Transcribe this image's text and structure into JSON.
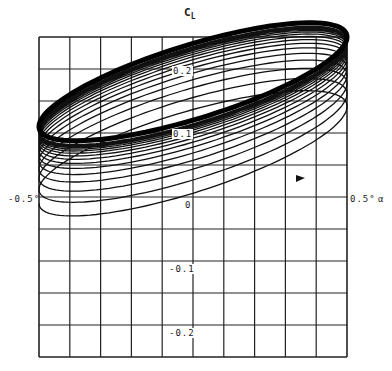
{
  "chart_data": {
    "type": "line",
    "title": "",
    "ylabel": "C_L",
    "xlabel": "α",
    "xlim": [
      -0.5,
      0.5
    ],
    "ylim": [
      -0.25,
      0.25
    ],
    "x_unit": "deg",
    "grid": true,
    "grid_divisions": {
      "x": 10,
      "y": 10
    },
    "x_tick_labels": [
      "-0.5°",
      "0",
      "0.5°"
    ],
    "y_tick_labels": [
      "0.2",
      "0.1",
      "-0.1",
      "-0.2"
    ],
    "annotations": [
      "arrow indicating clockwise/rightward direction on lower branch near α≈0.35°, C_L≈0.06"
    ],
    "series": [
      {
        "name": "initial loop",
        "center_CL": 0.06,
        "amplitude_CL": 0.06,
        "slope_CL_per_halfdeg": 0.07
      },
      {
        "name": "converged loop",
        "center_CL": 0.18,
        "amplitude_CL": 0.06,
        "slope_CL_per_halfdeg": 0.07
      }
    ],
    "loop_count": 16,
    "converged_loop_points": {
      "alpha": [
        -0.5,
        -0.25,
        0.0,
        0.25,
        0.5,
        0.25,
        0.0,
        -0.25
      ],
      "CL": [
        0.11,
        0.19,
        0.24,
        0.26,
        0.25,
        0.17,
        0.12,
        0.11
      ]
    }
  },
  "axes": {
    "y_title": "C",
    "y_title_sub": "L",
    "x_title": "α",
    "x_min_label": "-0.5°",
    "x_zero_label": "0",
    "x_max_label": "0.5°",
    "y_labels": [
      "0.2",
      "0.1",
      "-0.1",
      "-0.2"
    ]
  }
}
